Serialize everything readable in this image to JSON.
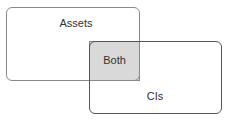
{
  "diagram": {
    "type": "overlap-diagram",
    "regions": [
      {
        "id": "assets",
        "label": "Assets"
      },
      {
        "id": "both",
        "label": "Both"
      },
      {
        "id": "cis",
        "label": "CIs"
      }
    ],
    "colors": {
      "overlap_fill": "#d9d9d9",
      "assets_border": "#8a8a8a",
      "cis_border": "#555555",
      "text": "#333333"
    }
  }
}
